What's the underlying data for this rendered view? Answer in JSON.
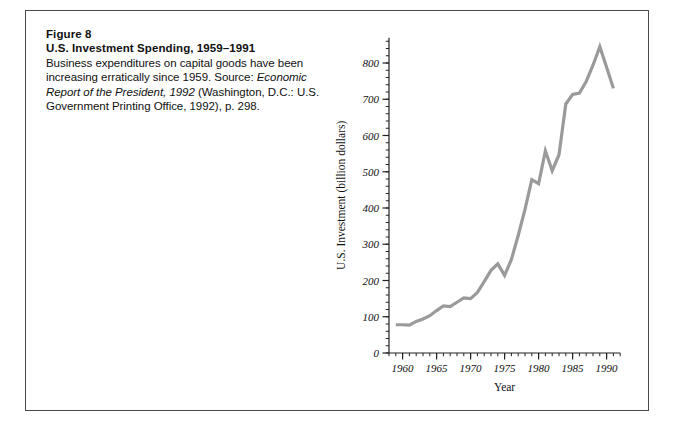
{
  "figure": {
    "number_label": "Figure 8",
    "title": "U.S. Investment Spending, 1959–1991",
    "caption_part1": "Business expenditures on capital goods have been increasing erratically since 1959. Source: ",
    "caption_italic1": "Economic Report of the President, 1992",
    "caption_part2": " (Washington, D.C.: U.S. Government Printing Office, 1992), p. 298."
  },
  "chart_data": {
    "type": "line",
    "title": "",
    "xlabel": "Year",
    "ylabel": "U.S. Investment (billion dollars)",
    "xlim": [
      1958,
      1992
    ],
    "ylim": [
      0,
      870
    ],
    "xticks": [
      1960,
      1965,
      1970,
      1975,
      1980,
      1985,
      1990
    ],
    "xtick_labels": [
      "1960",
      "1965",
      "1970",
      "1975",
      "1980",
      "1985",
      "1990"
    ],
    "x_minor_tick_step": 1,
    "yticks": [
      0,
      100,
      200,
      300,
      400,
      500,
      600,
      700,
      800
    ],
    "ytick_labels": [
      "0",
      "100",
      "200",
      "300",
      "400",
      "500",
      "600",
      "700",
      "800"
    ],
    "y_minor_tick_step": 20,
    "grid": false,
    "legend": false,
    "line_color": "#9a9a9a",
    "line_width": 3.2,
    "x": [
      1959,
      1960,
      1961,
      1962,
      1963,
      1964,
      1965,
      1966,
      1967,
      1968,
      1969,
      1970,
      1971,
      1972,
      1973,
      1974,
      1975,
      1976,
      1977,
      1978,
      1979,
      1980,
      1981,
      1982,
      1983,
      1984,
      1985,
      1986,
      1987,
      1988,
      1989,
      1990,
      1991
    ],
    "values": [
      78,
      78,
      77,
      87,
      94,
      103,
      117,
      130,
      128,
      140,
      152,
      150,
      167,
      197,
      228,
      246,
      214,
      258,
      324,
      396,
      478,
      467,
      558,
      503,
      547,
      687,
      713,
      717,
      749,
      794,
      845,
      788,
      730
    ],
    "series": [
      {
        "name": "U.S. Investment",
        "values": [
          78,
          78,
          77,
          87,
          94,
          103,
          117,
          130,
          128,
          140,
          152,
          150,
          167,
          197,
          228,
          246,
          214,
          258,
          324,
          396,
          478,
          467,
          558,
          503,
          547,
          687,
          713,
          717,
          749,
          794,
          845,
          788,
          730
        ]
      }
    ]
  }
}
